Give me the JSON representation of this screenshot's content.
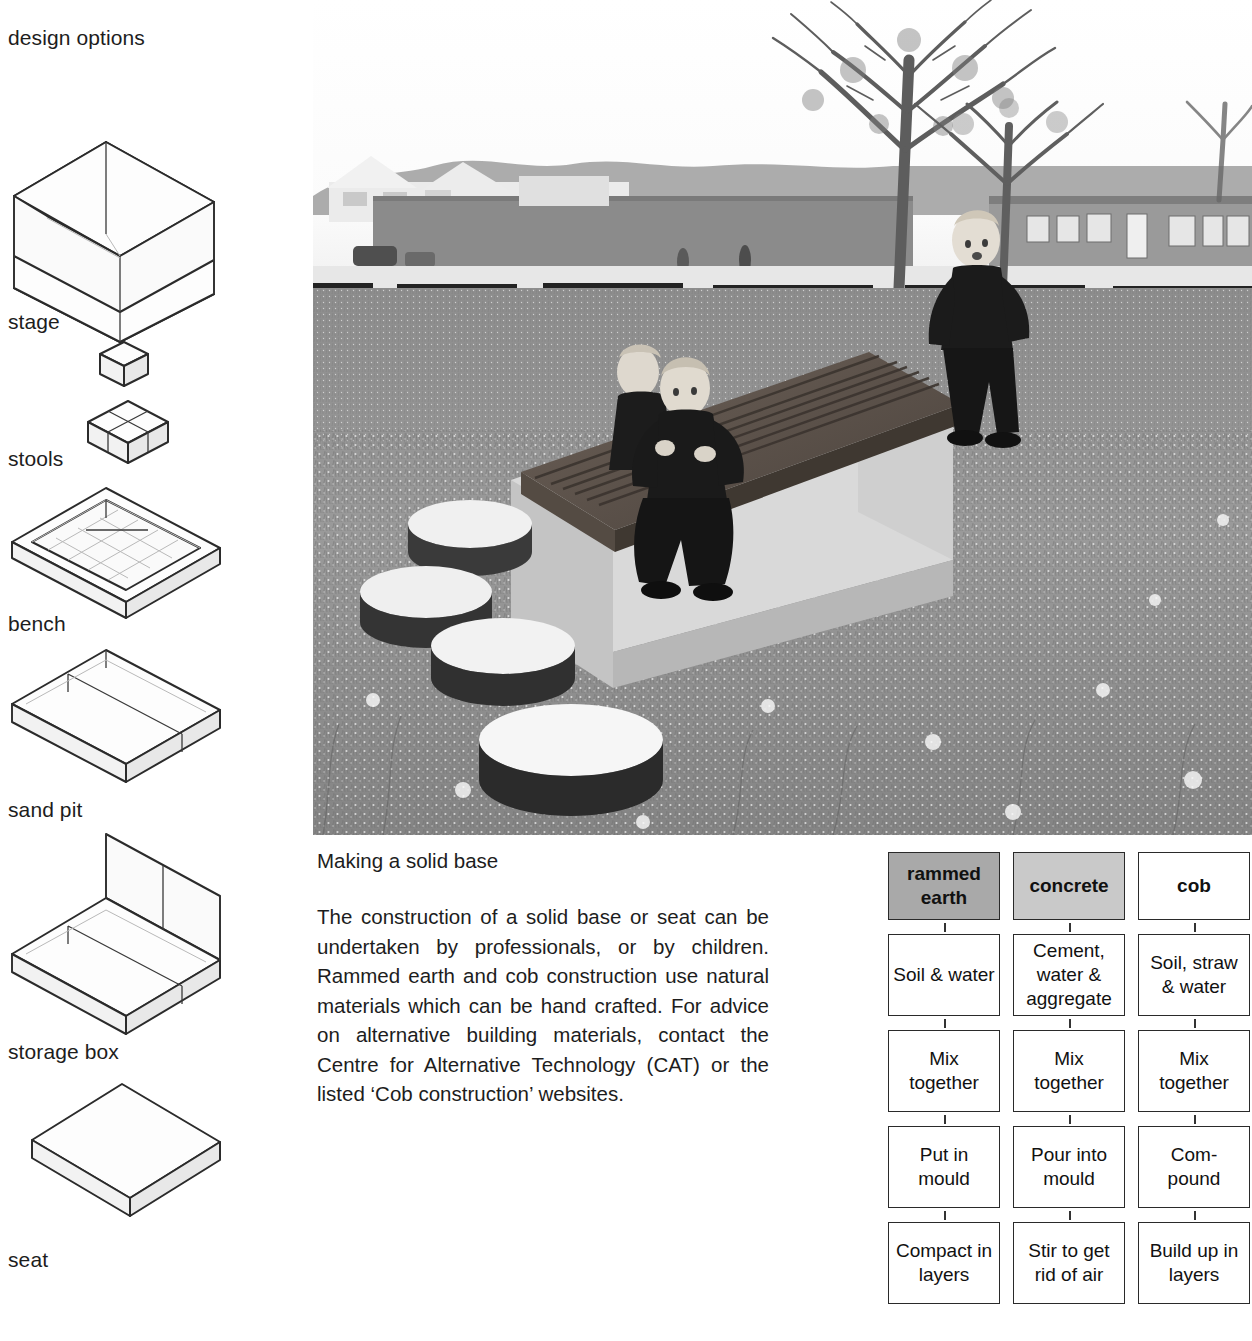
{
  "sidebar": {
    "heading": "design options",
    "items": [
      {
        "label": "stage",
        "icon": "open-box-stage-icon"
      },
      {
        "label": "stools",
        "icon": "cube-stools-icon"
      },
      {
        "label": "bench",
        "icon": "tray-bench-icon"
      },
      {
        "label": "sand pit",
        "icon": "split-slab-sandpit-icon"
      },
      {
        "label": "storage box",
        "icon": "backed-box-storage-icon"
      },
      {
        "label": "seat",
        "icon": "slab-seat-icon"
      }
    ]
  },
  "photo": {
    "caption_alt": "Children on a timber deck seat set on a concrete base in a wildflower meadow, with log stepping stools, bare trees and school buildings behind",
    "scene": {
      "sky": "overcast white sky",
      "trees": "two bare deciduous trees",
      "buildings": "low brick school buildings and a long single-storey block with windows",
      "foreground": "tall grass and daisies",
      "structure": "timber-topped deck on concrete plinth",
      "people": "three children in dark uniforms",
      "stepping_stones": "four round log discs"
    }
  },
  "article": {
    "heading": "Making a solid base",
    "body": "The construction of a solid base or seat can be undertaken by professionals, or by children. Rammed earth and cob construction use natural materials which can be hand crafted. For advice on alternative building materials, contact the Centre for  Alternative Technology (CAT) or the listed ‘Cob construction’ websites."
  },
  "flowchart": {
    "type": "process-columns",
    "colors": {
      "rammed_earth_header": "#a9a9a9",
      "concrete_header": "#c9c9c9",
      "cob_header": "#ffffff",
      "border": "#2a2a2a"
    },
    "columns": [
      {
        "header": "rammed earth",
        "shade": "shade-dark",
        "steps": [
          "Soil & water",
          "Mix together",
          "Put in mould",
          "Compact in layers"
        ]
      },
      {
        "header": "concrete",
        "shade": "shade-light",
        "steps": [
          "Cement, water & aggregate",
          "Mix together",
          "Pour into mould",
          "Stir to get rid of air"
        ]
      },
      {
        "header": "cob",
        "shade": "shade-none",
        "steps": [
          "Soil, straw & water",
          "Mix together",
          "Com- pound",
          "Build up in layers"
        ]
      }
    ]
  }
}
